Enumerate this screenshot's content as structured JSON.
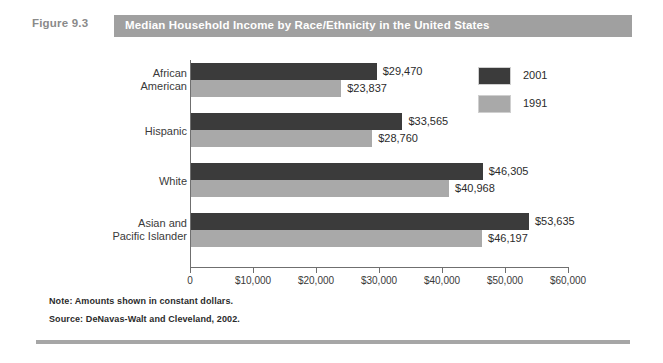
{
  "figure": {
    "number_label": "Figure 9.3",
    "title": "Median Household Income by Race/Ethnicity in the United States",
    "note": "Note: Amounts shown in constant dollars.",
    "source": "Source: DeNavas-Walt and Cleveland, 2002."
  },
  "colors": {
    "title_bar": "#a0a0a0",
    "series_2001": "#3b3b3b",
    "series_1991": "#a9a9a9",
    "axis": "#6f6f6f",
    "rule": "#a6a6a6"
  },
  "legend": {
    "position": "top-right",
    "items": [
      {
        "label": "2001",
        "color": "#3b3b3b"
      },
      {
        "label": "1991",
        "color": "#a9a9a9"
      }
    ]
  },
  "chart_data": {
    "type": "bar",
    "orientation": "horizontal",
    "title": "Median Household Income by Race/Ethnicity in the United States",
    "xlabel": "",
    "ylabel": "",
    "xlim": [
      0,
      60000
    ],
    "grid": false,
    "legend_position": "top-right",
    "categories": [
      "African American",
      "Hispanic",
      "White",
      "Asian and Pacific Islander"
    ],
    "category_lines": [
      [
        "African",
        "American"
      ],
      [
        "Hispanic"
      ],
      [
        "White"
      ],
      [
        "Asian and",
        "Pacific Islander"
      ]
    ],
    "tick_values": [
      0,
      10000,
      20000,
      30000,
      40000,
      50000,
      60000
    ],
    "tick_labels": [
      "0",
      "$10,000",
      "$20,000",
      "$30,000",
      "$40,000",
      "$50,000",
      "$60,000"
    ],
    "series": [
      {
        "name": "2001",
        "color": "#3b3b3b",
        "values": [
          29470,
          33565,
          46305,
          53635
        ],
        "value_labels": [
          "$29,470",
          "$33,565",
          "$46,305",
          "$53,635"
        ]
      },
      {
        "name": "1991",
        "color": "#a9a9a9",
        "values": [
          23837,
          28760,
          40968,
          46197
        ],
        "value_labels": [
          "$23,837",
          "$28,760",
          "$40,968",
          "$46,197"
        ]
      }
    ],
    "annotations": [
      "Note: Amounts shown in constant dollars.",
      "Source: DeNavas-Walt and Cleveland, 2002."
    ]
  }
}
